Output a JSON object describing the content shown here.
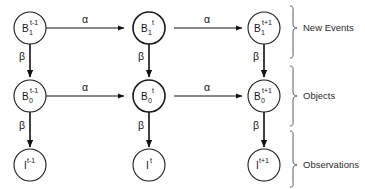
{
  "diagram": {
    "rows": [
      {
        "id": "new-events",
        "group_label": "New Events",
        "nodes": [
          {
            "base": "B",
            "sub": "1",
            "sup": "t-1",
            "emphasis": "normal"
          },
          {
            "base": "B",
            "sub": "1",
            "sup": "t",
            "emphasis": "bold"
          },
          {
            "base": "B",
            "sub": "1",
            "sup": "t+1",
            "emphasis": "normal"
          }
        ]
      },
      {
        "id": "objects",
        "group_label": "Objects",
        "nodes": [
          {
            "base": "B",
            "sub": "0",
            "sup": "t-1",
            "emphasis": "normal"
          },
          {
            "base": "B",
            "sub": "0",
            "sup": "t",
            "emphasis": "bold"
          },
          {
            "base": "B",
            "sub": "0",
            "sup": "t+1",
            "emphasis": "normal"
          }
        ]
      },
      {
        "id": "observations",
        "group_label": "Observations",
        "nodes": [
          {
            "base": "I",
            "sub": "",
            "sup": "t-1",
            "emphasis": "normal"
          },
          {
            "base": "I",
            "sub": "",
            "sup": "t",
            "emphasis": "normal"
          },
          {
            "base": "I",
            "sub": "",
            "sup": "t+1",
            "emphasis": "normal"
          }
        ]
      }
    ],
    "horizontal_edge_label": "α",
    "vertical_edge_label": "β",
    "horizontal_edges": [
      {
        "row": "new-events",
        "from": "B1^t-1",
        "to": "B1^t",
        "label": "α"
      },
      {
        "row": "new-events",
        "from": "B1^t",
        "to": "B1^t+1",
        "label": "α"
      },
      {
        "row": "objects",
        "from": "B0^t-1",
        "to": "B0^t",
        "label": "α"
      },
      {
        "row": "objects",
        "from": "B0^t",
        "to": "B0^t+1",
        "label": "α"
      }
    ],
    "vertical_edges": [
      {
        "column": 0,
        "from": "B1^t-1",
        "to": "B0^t-1",
        "label": "β"
      },
      {
        "column": 1,
        "from": "B1^t",
        "to": "B0^t",
        "label": "β"
      },
      {
        "column": 2,
        "from": "B1^t+1",
        "to": "B0^t+1",
        "label": "β"
      },
      {
        "column": 0,
        "from": "B0^t-1",
        "to": "I^t-1",
        "label": "β"
      },
      {
        "column": 1,
        "from": "B0^t",
        "to": "I^t",
        "label": "β"
      },
      {
        "column": 2,
        "from": "B0^t+1",
        "to": "I^t+1",
        "label": "β"
      }
    ],
    "colors": {
      "background": "#ffffff",
      "stroke": "#111111",
      "text": "#141414",
      "brace": "#5a5a5a"
    }
  }
}
